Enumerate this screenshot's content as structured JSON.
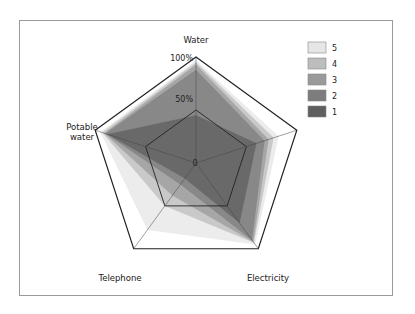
{
  "chart_data": {
    "type": "radar",
    "title": "",
    "axes": [
      "Water",
      "Sewerage",
      "Electricity",
      "Telephone",
      "Potable water"
    ],
    "axis_labels": {
      "water": "Water",
      "sewerage": "Sewerage",
      "electricity": "Electricity",
      "telephone": "Telephone",
      "potable_water_line1": "Potable",
      "potable_water_line2": "water"
    },
    "tick_labels": [
      "0",
      "50%",
      "100%"
    ],
    "range": [
      0,
      100
    ],
    "legend_position": "top-right",
    "series": [
      {
        "name": "5",
        "color": "#e6e6e6",
        "values": [
          97,
          82,
          95,
          78,
          95
        ]
      },
      {
        "name": "4",
        "color": "#bdbdbd",
        "values": [
          95,
          77,
          93,
          50,
          93
        ]
      },
      {
        "name": "3",
        "color": "#9a9a9a",
        "values": [
          93,
          72,
          92,
          38,
          91
        ]
      },
      {
        "name": "2",
        "color": "#7d7d7d",
        "values": [
          88,
          68,
          90,
          25,
          90
        ]
      },
      {
        "name": "1",
        "color": "#5f5f5f",
        "values": [
          45,
          60,
          70,
          18,
          88
        ]
      }
    ]
  },
  "legend": {
    "items": [
      "5",
      "4",
      "3",
      "2",
      "1"
    ]
  }
}
